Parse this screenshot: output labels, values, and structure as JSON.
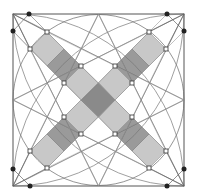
{
  "diagram": {
    "square": {
      "x1": 13,
      "y1": 14,
      "x2": 184,
      "y2": 186
    },
    "center": [
      98.5,
      100
    ],
    "inscribed_circle_radius": 85.5,
    "colors": {
      "frame": "#555555",
      "tile_light": "#c8c8c8",
      "tile_dark": "#9a9a9a",
      "tile_center": "#8a8a8a",
      "dot_filled": "#222222",
      "dot_open": "#ffffff"
    },
    "filled_dots": [
      [
        29,
        14
      ],
      [
        13,
        31
      ],
      [
        167,
        14
      ],
      [
        184,
        31
      ],
      [
        184,
        169
      ],
      [
        167,
        186
      ],
      [
        13,
        169
      ],
      [
        30,
        186
      ]
    ],
    "open_dots": [
      [
        47,
        32
      ],
      [
        30,
        49
      ],
      [
        81,
        66
      ],
      [
        64,
        83
      ],
      [
        149,
        32
      ],
      [
        166,
        49
      ],
      [
        115,
        66
      ],
      [
        132,
        83
      ],
      [
        132,
        117
      ],
      [
        115,
        134
      ],
      [
        166,
        151
      ],
      [
        149,
        168
      ],
      [
        64,
        117
      ],
      [
        81,
        134
      ],
      [
        30,
        151
      ],
      [
        47,
        168
      ]
    ],
    "tile_count": 9,
    "legend": []
  }
}
